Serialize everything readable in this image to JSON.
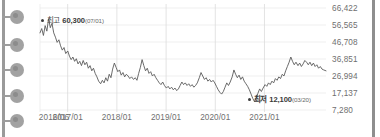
{
  "rail": {
    "nodes": [
      {
        "name": "rail-node-1",
        "y": 10
      },
      {
        "name": "rail-node-2",
        "y": 38
      },
      {
        "name": "rail-node-3",
        "y": 63
      },
      {
        "name": "rail-node-4",
        "y": 89
      },
      {
        "name": "rail-node-5",
        "y": 114
      }
    ]
  },
  "scrollbar": {
    "name": "vertical-scrollbar"
  },
  "annotations": {
    "high": {
      "label": "최고",
      "value": "60,300",
      "date": "(07/01)",
      "marker": "bullet-dot"
    },
    "low": {
      "label": "최저",
      "value": "12,100",
      "date": "(03/20)",
      "marker": "bullet-dot"
    }
  },
  "chart_data": {
    "type": "line",
    "title": "",
    "xlabel": "",
    "ylabel": "",
    "grid": true,
    "legend": null,
    "ylim": [
      7280,
      66422
    ],
    "yticks": [
      66422,
      56565,
      46708,
      36851,
      26994,
      17137,
      7280
    ],
    "ytick_labels": [
      "66,422",
      "56,565",
      "46,708",
      "36,851",
      "26,994",
      "17,137",
      "7,280"
    ],
    "xticks": [
      "2016/06",
      "2017/01",
      "2018/01",
      "2019/01",
      "2020/01",
      "2021/01"
    ],
    "xtick_positions": [
      0.0,
      0.0968,
      0.2688,
      0.4409,
      0.6129,
      0.7849
    ],
    "line_color": "#5a5a5a",
    "grid_color": "#ebebeb",
    "background": "#ffffff",
    "highest": {
      "value": 60300,
      "date": "07/01",
      "x_frac": 0.027
    },
    "lowest": {
      "value": 12100,
      "date": "03/20",
      "x_frac": 0.672
    },
    "series": [
      {
        "name": "price",
        "x": [
          0.0,
          0.006,
          0.012,
          0.018,
          0.024,
          0.03,
          0.036,
          0.042,
          0.048,
          0.054,
          0.06,
          0.066,
          0.072,
          0.078,
          0.084,
          0.09,
          0.097,
          0.103,
          0.109,
          0.115,
          0.121,
          0.127,
          0.133,
          0.139,
          0.145,
          0.151,
          0.157,
          0.163,
          0.169,
          0.175,
          0.181,
          0.187,
          0.193,
          0.199,
          0.205,
          0.212,
          0.218,
          0.224,
          0.23,
          0.236,
          0.242,
          0.248,
          0.254,
          0.26,
          0.266,
          0.272,
          0.278,
          0.284,
          0.29,
          0.296,
          0.302,
          0.308,
          0.314,
          0.32,
          0.327,
          0.333,
          0.339,
          0.345,
          0.351,
          0.357,
          0.363,
          0.369,
          0.375,
          0.381,
          0.387,
          0.393,
          0.399,
          0.405,
          0.411,
          0.417,
          0.423,
          0.429,
          0.435,
          0.442,
          0.448,
          0.454,
          0.46,
          0.466,
          0.472,
          0.478,
          0.484,
          0.49,
          0.496,
          0.502,
          0.508,
          0.514,
          0.52,
          0.526,
          0.532,
          0.538,
          0.544,
          0.55,
          0.557,
          0.563,
          0.569,
          0.575,
          0.581,
          0.587,
          0.593,
          0.599,
          0.605,
          0.611,
          0.617,
          0.623,
          0.629,
          0.635,
          0.641,
          0.647,
          0.653,
          0.659,
          0.665,
          0.672,
          0.678,
          0.684,
          0.69,
          0.696,
          0.702,
          0.708,
          0.714,
          0.72,
          0.726,
          0.732,
          0.738,
          0.744,
          0.75,
          0.756,
          0.762,
          0.768,
          0.774,
          0.78,
          0.787,
          0.793,
          0.799,
          0.805,
          0.811,
          0.817,
          0.823,
          0.829,
          0.835,
          0.841,
          0.847,
          0.853,
          0.859,
          0.865,
          0.871,
          0.877,
          0.883,
          0.889,
          0.895,
          0.902,
          0.908,
          0.914,
          0.92,
          0.926,
          0.932,
          0.938,
          0.944,
          0.95,
          0.956,
          0.962,
          0.968,
          0.974,
          0.98,
          0.986,
          0.992,
          1.0
        ],
        "values": [
          52000,
          54500,
          50500,
          56200,
          53000,
          60300,
          55000,
          57500,
          52000,
          49500,
          46500,
          48000,
          44500,
          42000,
          43500,
          40000,
          41500,
          38500,
          36500,
          38000,
          35500,
          37000,
          34000,
          35500,
          33000,
          36000,
          33500,
          35000,
          31500,
          33000,
          30000,
          31500,
          28500,
          26500,
          24000,
          22500,
          24500,
          23000,
          26000,
          24000,
          28000,
          26000,
          31000,
          34500,
          32000,
          29500,
          30500,
          27500,
          29000,
          26500,
          28000,
          27000,
          25500,
          26500,
          25000,
          26000,
          24500,
          28500,
          32000,
          36500,
          33000,
          30000,
          31500,
          28500,
          29500,
          27000,
          28000,
          26000,
          24500,
          23000,
          22000,
          23500,
          21500,
          20000,
          21000,
          19500,
          20500,
          19000,
          20000,
          18500,
          19500,
          21500,
          23500,
          22000,
          23000,
          21500,
          22500,
          21000,
          22000,
          20500,
          21500,
          23000,
          26000,
          29000,
          27000,
          25000,
          26000,
          24000,
          25000,
          23500,
          24500,
          23000,
          21000,
          19000,
          17500,
          16500,
          18000,
          20500,
          23000,
          21500,
          23500,
          26500,
          30500,
          28000,
          26000,
          27500,
          25000,
          26500,
          24000,
          22500,
          21000,
          19000,
          16500,
          14000,
          12100,
          14500,
          17000,
          19500,
          18000,
          20000,
          22000,
          21000,
          23000,
          22000,
          24000,
          23000,
          25500,
          24500,
          26500,
          25500,
          28000,
          27000,
          30000,
          32500,
          35000,
          38000,
          35500,
          33500,
          35000,
          33000,
          34500,
          32500,
          34000,
          36000,
          35000,
          33500,
          35000,
          33000,
          34500,
          32500,
          33500,
          31500,
          32500,
          31000,
          30500,
          30000
        ]
      }
    ]
  }
}
